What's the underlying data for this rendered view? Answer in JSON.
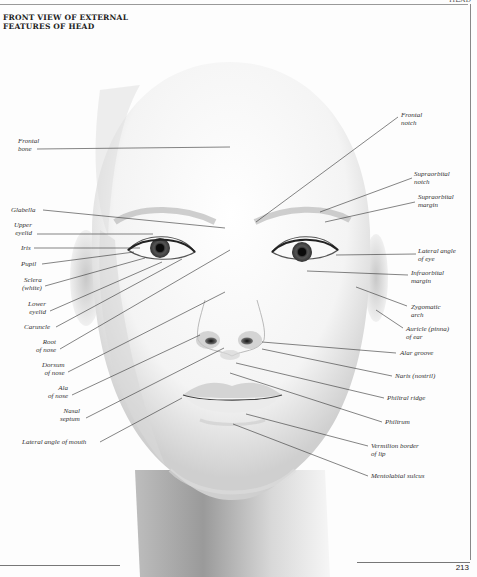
{
  "page": {
    "running_head": "HEAD",
    "title_line1": "FRONT VIEW OF EXTERNAL",
    "title_line2": "FEATURES OF HEAD",
    "page_number": "213"
  },
  "labels_left": [
    {
      "id": "frontal-bone",
      "line1": "Frontal",
      "line2": "bone"
    },
    {
      "id": "glabella",
      "line1": "Glabella",
      "line2": ""
    },
    {
      "id": "upper-eyelid",
      "line1": "Upper",
      "line2": "eyelid"
    },
    {
      "id": "iris",
      "line1": "Iris",
      "line2": ""
    },
    {
      "id": "pupil",
      "line1": "Pupil",
      "line2": ""
    },
    {
      "id": "sclera",
      "line1": "Sclera",
      "line2": "(white)"
    },
    {
      "id": "lower-eyelid",
      "line1": "Lower",
      "line2": "eyelid"
    },
    {
      "id": "caruncle",
      "line1": "Caruncle",
      "line2": ""
    },
    {
      "id": "root-of-nose",
      "line1": "Root",
      "line2": "of nose"
    },
    {
      "id": "dorsum-of-nose",
      "line1": "Dorsum",
      "line2": "of nose"
    },
    {
      "id": "ala-of-nose",
      "line1": "Ala",
      "line2": "of nose"
    },
    {
      "id": "nasal-septum",
      "line1": "Nasal",
      "line2": "septum"
    },
    {
      "id": "lateral-angle-of-mouth",
      "line1": "Lateral angle of mouth",
      "line2": ""
    }
  ],
  "labels_right": [
    {
      "id": "frontal-notch",
      "line1": "Frontal",
      "line2": "notch"
    },
    {
      "id": "supraorbital-notch",
      "line1": "Supraorbital",
      "line2": "notch"
    },
    {
      "id": "supraorbital-margin",
      "line1": "Supraorbital",
      "line2": "margin"
    },
    {
      "id": "lateral-angle-of-eye",
      "line1": "Lateral angle",
      "line2": "of eye"
    },
    {
      "id": "infraorbital-margin",
      "line1": "Infraorbital",
      "line2": "margin"
    },
    {
      "id": "zygomatic-arch",
      "line1": "Zygomatic",
      "line2": "arch"
    },
    {
      "id": "auricle",
      "line1": "Auricle (pinna)",
      "line2": "of ear"
    },
    {
      "id": "alar-groove",
      "line1": "Alar groove",
      "line2": ""
    },
    {
      "id": "naris",
      "line1": "Naris (nostril)",
      "line2": ""
    },
    {
      "id": "philtral-ridge",
      "line1": "Philtral ridge",
      "line2": ""
    },
    {
      "id": "philtrum",
      "line1": "Philtrum",
      "line2": ""
    },
    {
      "id": "vermilion-border",
      "line1": "Vermilion border",
      "line2": "of lip"
    },
    {
      "id": "mentolabial-sulcus",
      "line1": "Mentolabial sulcus",
      "line2": ""
    }
  ]
}
